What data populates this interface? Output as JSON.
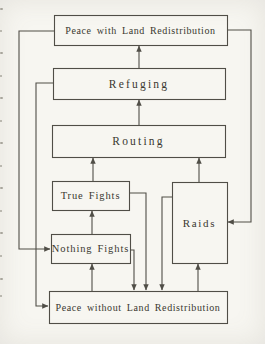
{
  "figure": {
    "type": "flowchart",
    "canvas": {
      "width": 265,
      "height": 344
    },
    "palette": {
      "paper": "#f7f6f1",
      "ink": "#504e47",
      "text": "#3a3830",
      "edge_artifact": "#97948a"
    },
    "nodes": [
      {
        "id": "peace-with-land-redistribution",
        "label": "Peace with Land Redistribution",
        "x": 54,
        "y": 15,
        "w": 173,
        "h": 30,
        "size": "wide"
      },
      {
        "id": "refuging",
        "label": "Refuging",
        "x": 53,
        "y": 68,
        "w": 172,
        "h": 31,
        "size": "mid"
      },
      {
        "id": "routing",
        "label": "Routing",
        "x": 52,
        "y": 125,
        "w": 173,
        "h": 32,
        "size": "mid"
      },
      {
        "id": "true-fights",
        "label": "True Fights",
        "x": 52,
        "y": 181,
        "w": 77,
        "h": 29,
        "size": "small"
      },
      {
        "id": "nothing-fights",
        "label": "Nothing Fights",
        "x": 51,
        "y": 234,
        "w": 79,
        "h": 29,
        "size": "small"
      },
      {
        "id": "raids",
        "label": "Raids",
        "x": 172,
        "y": 182,
        "w": 55,
        "h": 81,
        "size": "raids"
      },
      {
        "id": "peace-without-land-redistribution",
        "label": "Peace without Land Redistribution",
        "x": 49,
        "y": 291,
        "w": 178,
        "h": 32,
        "size": "wide"
      }
    ],
    "edges": [
      {
        "from": "refuging",
        "to": "peace-with-land-redistribution",
        "points": [
          [
            139,
            68
          ],
          [
            139,
            46
          ]
        ]
      },
      {
        "from": "routing",
        "to": "refuging",
        "points": [
          [
            139,
            125
          ],
          [
            139,
            100
          ]
        ]
      },
      {
        "from": "true-fights",
        "to": "routing",
        "points": [
          [
            93,
            181
          ],
          [
            93,
            158
          ]
        ]
      },
      {
        "from": "raids",
        "to": "routing",
        "points": [
          [
            199,
            182
          ],
          [
            199,
            158
          ]
        ]
      },
      {
        "from": "nothing-fights",
        "to": "true-fights",
        "points": [
          [
            92,
            234
          ],
          [
            92,
            211
          ]
        ]
      },
      {
        "from": "peace-without-land-redistribution",
        "to": "nothing-fights",
        "points": [
          [
            92,
            291
          ],
          [
            92,
            264
          ]
        ]
      },
      {
        "from": "peace-without-land-redistribution",
        "to": "raids",
        "points": [
          [
            198,
            291
          ],
          [
            198,
            264
          ]
        ]
      },
      {
        "from": "peace-with-land-redistribution",
        "to": "nothing-fights",
        "points": [
          [
            54,
            31
          ],
          [
            19,
            31
          ],
          [
            19,
            249
          ],
          [
            50,
            249
          ]
        ]
      },
      {
        "from": "refuging",
        "to": "peace-without-land-redistribution",
        "points": [
          [
            53,
            83
          ],
          [
            36,
            83
          ],
          [
            36,
            306
          ],
          [
            48,
            306
          ]
        ]
      },
      {
        "from": "peace-with-land-redistribution",
        "to": "raids",
        "points": [
          [
            227,
            30
          ],
          [
            251,
            30
          ],
          [
            251,
            222
          ],
          [
            228,
            222
          ]
        ]
      },
      {
        "from": "true-fights",
        "to": "peace-without-land-redistribution",
        "points": [
          [
            129,
            193
          ],
          [
            146,
            193
          ],
          [
            146,
            290
          ]
        ]
      },
      {
        "from": "nothing-fights",
        "to": "peace-without-land-redistribution",
        "points": [
          [
            130,
            250
          ],
          [
            134,
            250
          ],
          [
            134,
            290
          ]
        ]
      },
      {
        "from": "raids",
        "to": "peace-without-land-redistribution",
        "points": [
          [
            172,
            197
          ],
          [
            162,
            197
          ],
          [
            162,
            290
          ]
        ]
      }
    ],
    "left_edge_artifact_ys": [
      8,
      30,
      52,
      75,
      97,
      120,
      142,
      165,
      187,
      210,
      232,
      255,
      278,
      295
    ]
  }
}
